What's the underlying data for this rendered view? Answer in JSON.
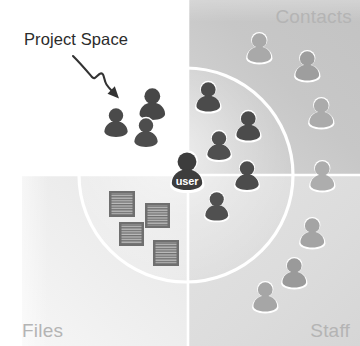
{
  "canvas": {
    "width": 360,
    "height": 346,
    "background": "#ffffff"
  },
  "diagram": {
    "title_label": "Project Space",
    "center_node_label": "user",
    "quadrants": [
      {
        "key": "blank",
        "label": "",
        "position": "top-left",
        "fill": "#ffffff"
      },
      {
        "key": "contacts",
        "label": "Contacts",
        "position": "top-right",
        "fill": "#c9c9c9"
      },
      {
        "key": "files",
        "label": "Files",
        "position": "bottom-left",
        "fill": "#efefef"
      },
      {
        "key": "staff",
        "label": "Staff",
        "position": "bottom-right",
        "fill": "#dedede"
      }
    ],
    "colors": {
      "person_inside_circle": "#4a4a4a",
      "person_outside_circle": "#a6a6a6",
      "center_user_node": "#404040",
      "document_icon_border": "#5a5a5a",
      "document_icon_fill": "#b0b0b0",
      "circle_outline": "#ffffff",
      "divider_line": "#ffffff",
      "label_text": "#b4b4b4",
      "annotation_text": "#2b2b2b",
      "arrow": "#333333"
    },
    "circle": {
      "cx": 186,
      "cy": 175,
      "r": 107,
      "stroke_width": 3
    },
    "dividers": {
      "vertical_x": 188,
      "horizontal_y": 175
    },
    "persons_inside": [
      {
        "x": 116,
        "y": 123,
        "scale": 1.0
      },
      {
        "x": 152,
        "y": 104,
        "scale": 1.08
      },
      {
        "x": 146,
        "y": 133,
        "scale": 1.0
      },
      {
        "x": 208,
        "y": 97,
        "scale": 1.02
      },
      {
        "x": 248,
        "y": 126,
        "scale": 1.02
      },
      {
        "x": 219,
        "y": 146,
        "scale": 1.0
      },
      {
        "x": 247,
        "y": 176,
        "scale": 1.0
      },
      {
        "x": 216,
        "y": 207,
        "scale": 0.96
      }
    ],
    "persons_outside": [
      {
        "x": 259,
        "y": 48,
        "scale": 1.02
      },
      {
        "x": 307,
        "y": 66,
        "scale": 1.02
      },
      {
        "x": 321,
        "y": 113,
        "scale": 1.02
      },
      {
        "x": 322,
        "y": 176,
        "scale": 1.02
      },
      {
        "x": 312,
        "y": 233,
        "scale": 1.02
      },
      {
        "x": 294,
        "y": 273,
        "scale": 1.02
      },
      {
        "x": 265,
        "y": 297,
        "scale": 1.02
      }
    ],
    "documents": [
      {
        "x": 109,
        "y": 191,
        "w": 25,
        "h": 25,
        "rot": 0
      },
      {
        "x": 145,
        "y": 203,
        "w": 24,
        "h": 24,
        "rot": 0
      },
      {
        "x": 121,
        "y": 222,
        "w": 24,
        "h": 23,
        "rot": 0
      },
      {
        "x": 153,
        "y": 240,
        "w": 24,
        "h": 24,
        "rot": 0
      }
    ],
    "annotation_arrow": {
      "path": "M 73 57 C 82 66, 86 71, 92 77 C 95 80, 97 74, 100 73 C 104 72, 103 80, 106 84 C 109 88, 113 91, 117 95",
      "head": "118,96 108,92 115,86"
    }
  }
}
